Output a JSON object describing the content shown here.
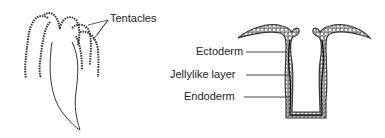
{
  "figures": {
    "hydra": {
      "labels": {
        "tentacles": "Tentacles"
      }
    },
    "cross_section": {
      "labels": {
        "ectoderm": "Ectoderm",
        "jellylike": "Jellylike layer",
        "endoderm": "Endoderm"
      }
    }
  },
  "colors": {
    "line": "#333333",
    "background": "#ffffff"
  }
}
